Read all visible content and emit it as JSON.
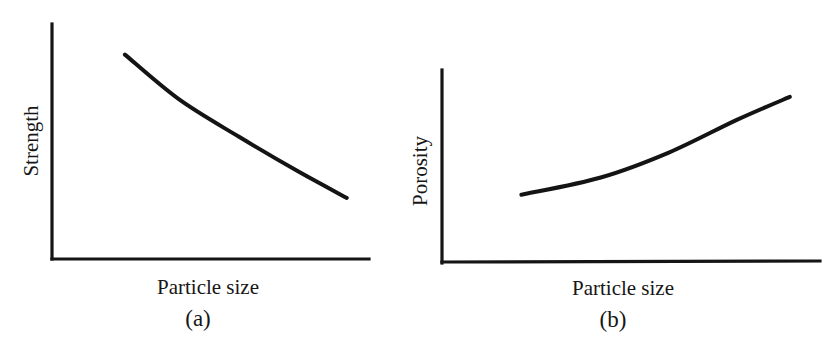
{
  "figure": {
    "panels": [
      {
        "id": "a",
        "tag": "(a)",
        "xlabel": "Particle size",
        "ylabel": "Strength"
      },
      {
        "id": "b",
        "tag": "(b)",
        "xlabel": "Particle size",
        "ylabel": "Porosity"
      }
    ],
    "colors": {
      "ink": "#141414",
      "background": "#ffffff"
    }
  },
  "chart_data": [
    {
      "type": "line",
      "panel": "(a)",
      "title": "",
      "xlabel": "Particle size",
      "ylabel": "Strength",
      "grid": false,
      "legend": "none",
      "ticks": "none",
      "axis_ranges": {
        "x": [
          0,
          1
        ],
        "y": [
          0,
          1
        ]
      },
      "trend": "decreasing, slightly concave-up (convex) curve",
      "series": [
        {
          "name": "Strength vs particle size",
          "x": [
            0.23,
            0.4,
            0.59,
            0.78,
            0.93
          ],
          "y": [
            0.87,
            0.68,
            0.52,
            0.37,
            0.26
          ]
        }
      ]
    },
    {
      "type": "line",
      "panel": "(b)",
      "title": "",
      "xlabel": "Particle size",
      "ylabel": "Porosity",
      "grid": false,
      "legend": "none",
      "ticks": "none",
      "axis_ranges": {
        "x": [
          0,
          1
        ],
        "y": [
          0,
          1
        ]
      },
      "trend": "increasing, concave-up curve",
      "series": [
        {
          "name": "Porosity vs particle size",
          "x": [
            0.21,
            0.42,
            0.6,
            0.78,
            0.92
          ],
          "y": [
            0.35,
            0.44,
            0.57,
            0.74,
            0.86
          ]
        }
      ]
    }
  ]
}
